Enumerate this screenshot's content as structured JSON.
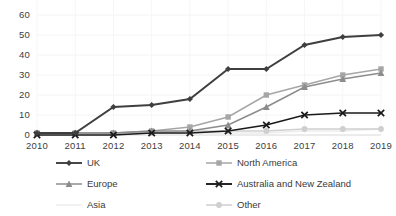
{
  "chart_data": {
    "type": "line",
    "title": "",
    "subtitle": "",
    "xlabel": "",
    "ylabel": "",
    "x": [
      2010,
      2011,
      2012,
      2013,
      2014,
      2015,
      2016,
      2017,
      2018,
      2019
    ],
    "xtick_labels": [
      "2010",
      "2011",
      "2012",
      "2013",
      "2014",
      "2015",
      "2016",
      "2017",
      "2018",
      "2019"
    ],
    "ytick_labels": [
      "0",
      "10",
      "20",
      "30",
      "40",
      "50",
      "60",
      "70"
    ],
    "yticks": [
      0,
      10,
      20,
      30,
      40,
      50,
      60,
      70
    ],
    "ylim": [
      0,
      70
    ],
    "grid": "faint-horizontal-and-vertical",
    "legend_position": "bottom, two columns, three rows",
    "series": [
      {
        "name": "UK",
        "marker": "diamond",
        "color": "#3f3f3f",
        "values": [
          1,
          1,
          14,
          15,
          18,
          33,
          33,
          45,
          49,
          50
        ]
      },
      {
        "name": "North America",
        "marker": "square",
        "color": "#a6a6a6",
        "values": [
          1,
          1,
          1,
          2,
          4,
          9,
          20,
          25,
          30,
          33
        ]
      },
      {
        "name": "Europe",
        "marker": "triangle",
        "color": "#8c8c8c",
        "values": [
          1,
          1,
          1,
          2,
          2,
          5,
          14,
          24,
          28,
          31
        ]
      },
      {
        "name": "Australia and New Zealand",
        "marker": "x",
        "color": "#1a1a1a",
        "values": [
          0,
          0,
          0,
          1,
          1,
          2,
          5,
          10,
          11,
          11
        ]
      },
      {
        "name": "Asia",
        "marker": "none",
        "color": "#ededed",
        "values": [
          0,
          0,
          0,
          0,
          1,
          1,
          1,
          2,
          2,
          3
        ]
      },
      {
        "name": "Other",
        "marker": "circle",
        "color": "#cfcfcf",
        "values": [
          1,
          1,
          1,
          1,
          2,
          2,
          2,
          3,
          3,
          3
        ]
      }
    ]
  },
  "legend": {
    "entries": [
      {
        "label": "UK"
      },
      {
        "label": "North America"
      },
      {
        "label": "Europe"
      },
      {
        "label": "Australia and New Zealand"
      },
      {
        "label": "Asia"
      },
      {
        "label": "Other"
      }
    ]
  }
}
